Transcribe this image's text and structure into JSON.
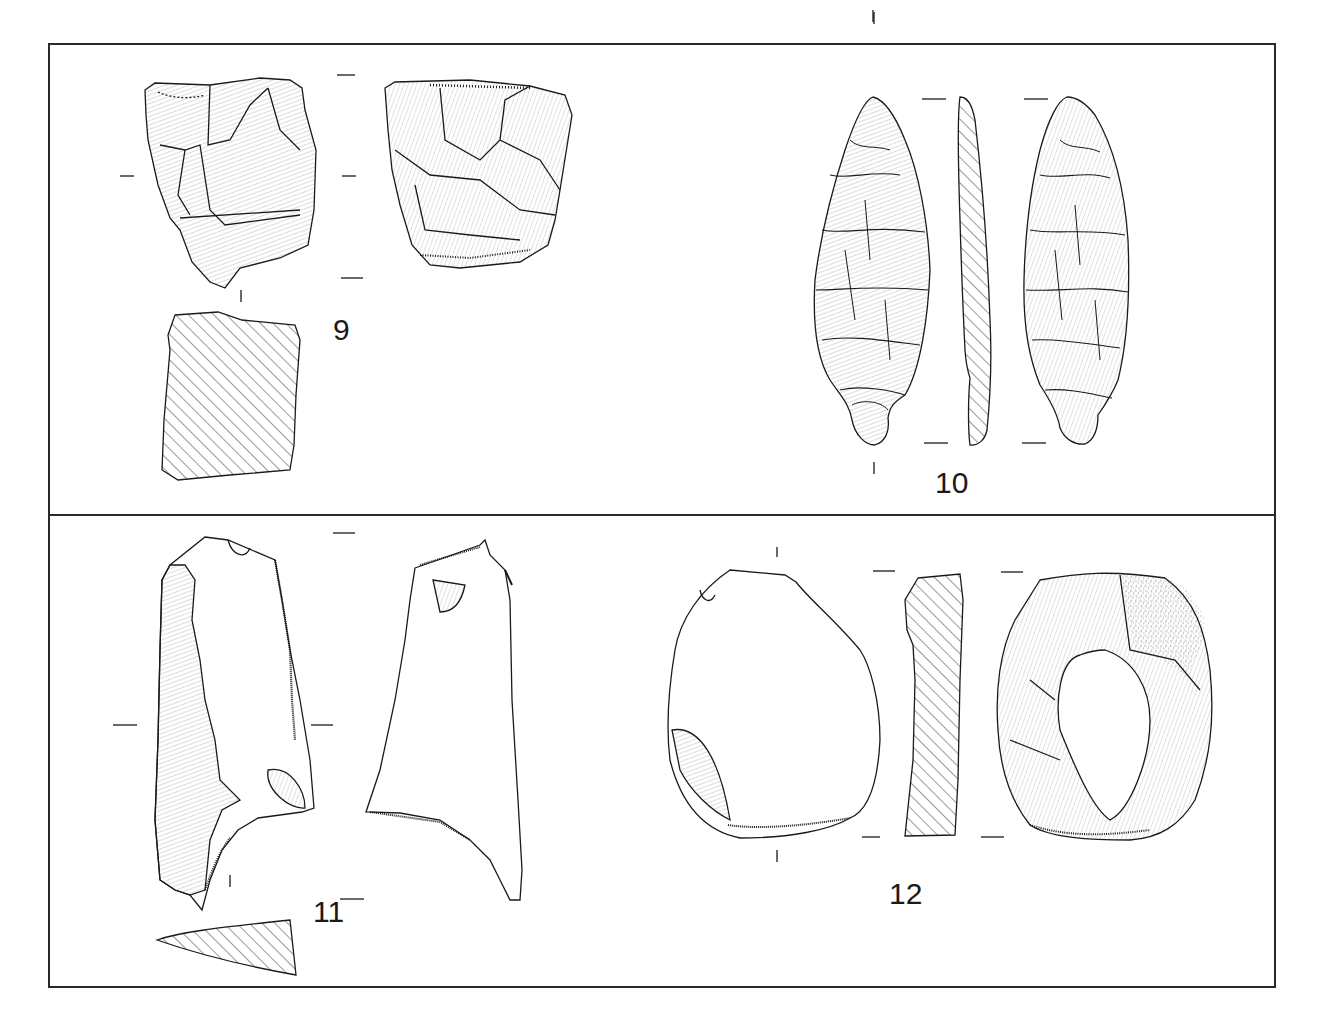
{
  "plate": {
    "border_color": "#2a2a2a",
    "line_color": "#1a1a1a",
    "panels": [
      {
        "id": "top",
        "figures": [
          {
            "number": "9",
            "description": "core / flake fragment, two faces with hatched section"
          },
          {
            "number": "10",
            "description": "bifacial leaf-shaped point with tang, face, profile section, reverse face"
          }
        ]
      },
      {
        "id": "bottom",
        "figures": [
          {
            "number": "11",
            "description": "retouched blade/flake, dorsal and ventral faces with triangular section"
          },
          {
            "number": "12",
            "description": "scraper / flake, ventral face, section, dorsal face with cortex stippling"
          }
        ]
      }
    ]
  },
  "labels": {
    "fig9": "9",
    "fig10": "10",
    "fig11": "11",
    "fig12": "12"
  }
}
